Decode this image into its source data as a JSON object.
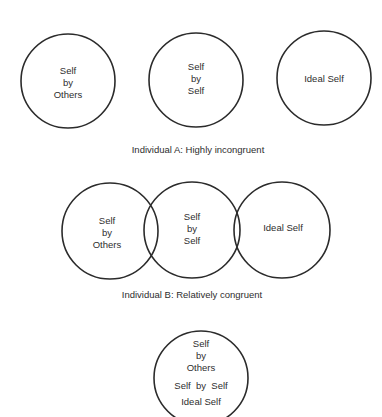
{
  "diagram": {
    "type": "self-congruence venn diagram",
    "top_fragment": "",
    "individual_a": {
      "caption": "Individual A:  Highly incongruent",
      "circles": [
        {
          "label_lines": [
            "Self",
            "by",
            "Others"
          ]
        },
        {
          "label_lines": [
            "Self",
            "by",
            "Self"
          ]
        },
        {
          "label_lines": [
            "Ideal Self"
          ]
        }
      ]
    },
    "individual_b": {
      "caption": "Individual B:  Relatively congruent",
      "circles": [
        {
          "label_lines": [
            "Self",
            "by",
            "Others"
          ]
        },
        {
          "label_lines": [
            "Self",
            "by",
            "Self"
          ]
        },
        {
          "label_lines": [
            "Ideal Self"
          ]
        }
      ]
    },
    "individual_c": {
      "circles": [
        {
          "label_lines": [
            "Self",
            "by",
            "Others",
            "Self  by  Self",
            "Ideal Self"
          ]
        }
      ]
    },
    "colors": {
      "stroke": "#2b2b2b",
      "text": "#2e2e2e",
      "background": "#ffffff"
    }
  }
}
